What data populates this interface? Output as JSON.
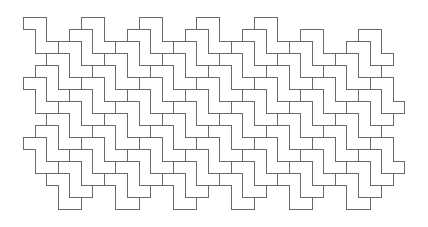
{
  "figure": {
    "type": "polyomino-tessellation",
    "tile_shape": "Z-pentomino",
    "tile_polygon_cells": [
      [
        0,
        0
      ],
      [
        2,
        0
      ],
      [
        2,
        2
      ],
      [
        3,
        2
      ],
      [
        3,
        3
      ],
      [
        1,
        3
      ],
      [
        1,
        1
      ],
      [
        0,
        1
      ]
    ],
    "lattice_vectors": [
      [
        5,
        0
      ],
      [
        -1,
        1
      ]
    ],
    "grid": {
      "origin_x": 23,
      "origin_y": 17,
      "cell_width": 11.55,
      "cell_height": 12
    },
    "colors": {
      "background": "#ffffff",
      "tile_fill": "#ffffff",
      "stroke": "#6a6a6a"
    },
    "stroke_width": 1,
    "rows": [
      {
        "row": 0,
        "origins_x": [
          0,
          5,
          10,
          15,
          20
        ]
      },
      {
        "row": 1,
        "origins_x": [
          4,
          9,
          14,
          19,
          24,
          29
        ]
      },
      {
        "row": 2,
        "origins_x": [
          3,
          8,
          13,
          18,
          23,
          28
        ]
      },
      {
        "row": 3,
        "origins_x": [
          2,
          7,
          12,
          17,
          22,
          27
        ]
      },
      {
        "row": 4,
        "origins_x": [
          1,
          6,
          11,
          16,
          21,
          26
        ]
      },
      {
        "row": 5,
        "origins_x": [
          0,
          5,
          10,
          15,
          20,
          25,
          30
        ]
      },
      {
        "row": 6,
        "origins_x": [
          4,
          9,
          14,
          19,
          24,
          29
        ]
      },
      {
        "row": 7,
        "origins_x": [
          3,
          8,
          13,
          18,
          23,
          28
        ]
      },
      {
        "row": 8,
        "origins_x": [
          2,
          7,
          12,
          17,
          22,
          27
        ]
      },
      {
        "row": 9,
        "origins_x": [
          1,
          6,
          11,
          16,
          21,
          26
        ]
      },
      {
        "row": 10,
        "origins_x": [
          0,
          5,
          10,
          15,
          20,
          25,
          30
        ]
      },
      {
        "row": 11,
        "origins_x": [
          4,
          9,
          14,
          19,
          24,
          29
        ]
      },
      {
        "row": 12,
        "origins_x": [
          3,
          8,
          13,
          18,
          23,
          28
        ]
      },
      {
        "row": 13,
        "origins_x": [
          2,
          7,
          12,
          17,
          22,
          27
        ]
      }
    ]
  }
}
